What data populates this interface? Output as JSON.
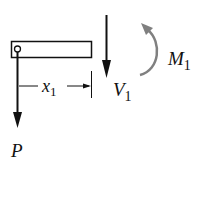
{
  "diagram": {
    "type": "free-body-diagram",
    "beam": {
      "label": "cantilever segment"
    },
    "labels": {
      "load": "P",
      "distance_main": "x",
      "distance_sub": "1",
      "shear_main": "V",
      "shear_sub": "1",
      "moment_main": "M",
      "moment_sub": "1"
    },
    "colors": {
      "ink": "#111111",
      "moment_arrow": "#808080",
      "background": "#ffffff"
    }
  }
}
